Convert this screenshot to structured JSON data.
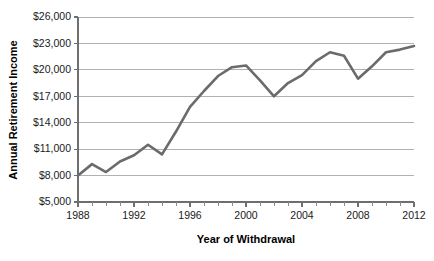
{
  "chart_data": {
    "type": "line",
    "title": "",
    "xlabel": "Year of Withdrawal",
    "ylabel": "Annual Retirement Income",
    "xlim": [
      1988,
      2012
    ],
    "ylim": [
      5000,
      26000
    ],
    "grid": true,
    "legend": false,
    "y_tick_labels": [
      "$26,000",
      "$23,000",
      "$20,000",
      "$17,000",
      "$14,000",
      "$11,000",
      "$8,000",
      "$5,000"
    ],
    "y_tick_values": [
      26000,
      23000,
      20000,
      17000,
      14000,
      11000,
      8000,
      5000
    ],
    "x_tick_labels": [
      "1988",
      "1992",
      "1996",
      "2000",
      "2004",
      "2008",
      "2012"
    ],
    "x_tick_values": [
      1988,
      1992,
      1996,
      2000,
      2004,
      2008,
      2012
    ],
    "x_minor_step": 1,
    "series": [
      {
        "name": "Annual Retirement Income",
        "color": "#6b6b6b",
        "x": [
          1988,
          1989,
          1990,
          1991,
          1992,
          1993,
          1994,
          1995,
          1996,
          1997,
          1998,
          1999,
          2000,
          2001,
          2002,
          2003,
          2004,
          2005,
          2006,
          2007,
          2008,
          2009,
          2010,
          2011,
          2012
        ],
        "values": [
          8000,
          9300,
          8400,
          9600,
          10300,
          11500,
          10400,
          13000,
          15800,
          17600,
          19300,
          20300,
          20500,
          18800,
          17000,
          18500,
          19400,
          21000,
          22000,
          21600,
          19000,
          20400,
          22000,
          22300,
          22700
        ]
      }
    ]
  },
  "axis_titles": {
    "x": "Year of Withdrawal",
    "y": "Annual Retirement Income"
  }
}
